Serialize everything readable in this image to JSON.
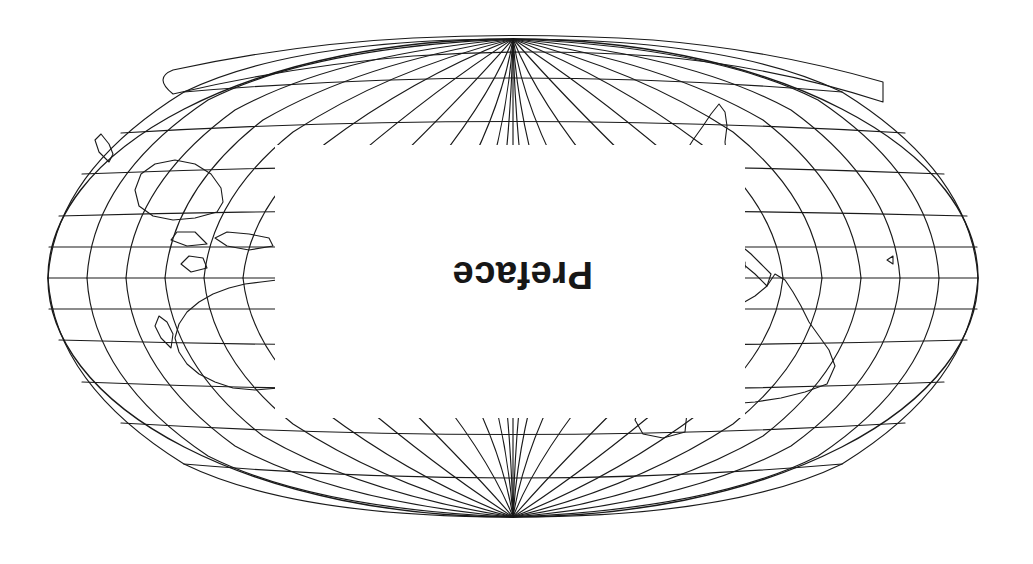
{
  "page": {
    "width": 1033,
    "height": 564,
    "background_color": "#ffffff",
    "ink_color": "#1a1a1a"
  },
  "chapter": {
    "title": "Preface",
    "orientation": "upside-down",
    "rotation_degrees": 180,
    "font_size_px": 38,
    "left_px": 440,
    "top_px": 268,
    "color": "#171717"
  },
  "figure": {
    "name": "world-map-mollweide",
    "projection": "Mollweide",
    "rotation_degrees": 180,
    "ellipse": {
      "center_x": 520,
      "center_y": 286,
      "radius_x": 465,
      "radius_y": 239
    },
    "graticule": {
      "meridian_spacing_degrees": 15,
      "parallel_spacing_degrees": 15,
      "line_color": "#1a1a1a",
      "line_width_px": 1.15,
      "visible": true
    },
    "mask": {
      "name": "white-centre-mask",
      "left_px": 288,
      "top_px": 146,
      "width_px": 470,
      "height_px": 273,
      "color": "#ffffff"
    },
    "coastlines": {
      "line_color": "#1a1a1a",
      "line_width_px": 1.1,
      "regions": [
        "Africa",
        "Europe",
        "Asia",
        "North America",
        "South America",
        "Australia",
        "Antarctica",
        "Greenland",
        "Indonesia",
        "Japan",
        "British Isles",
        "Madagascar",
        "New Zealand"
      ]
    },
    "poles": [
      {
        "name": "north-pole-convergence",
        "x_px": 336,
        "y_px": 432
      },
      {
        "name": "south-pole-convergence",
        "x_px": 704,
        "y_px": 135
      }
    ]
  }
}
